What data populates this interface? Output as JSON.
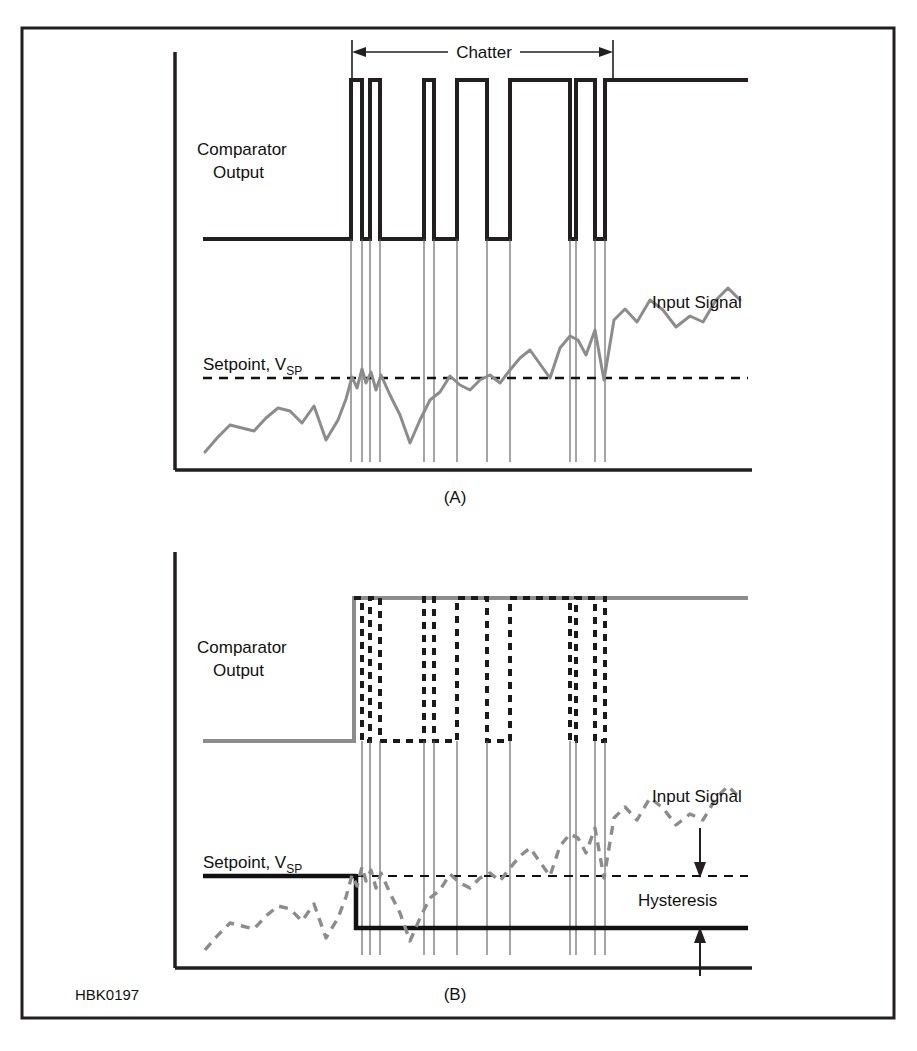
{
  "figure": {
    "code_label": "HBK0197",
    "border_color": "#231f20",
    "signal_color": "#8c8c8c",
    "trace_color": "#1a1a1a"
  },
  "panels": [
    {
      "id": "A",
      "panel_label": "(A)",
      "labels": {
        "comparator_line1": "Comparator",
        "comparator_line2": "Output",
        "input_signal": "Input Signal",
        "setpoint_main": "Setpoint, V",
        "setpoint_sub": "SP",
        "chatter": "Chatter"
      },
      "has_hysteresis": false,
      "comparator_style": "solid-black",
      "signal_style": "solid-gray"
    },
    {
      "id": "B",
      "panel_label": "(B)",
      "labels": {
        "comparator_line1": "Comparator",
        "comparator_line2": "Output",
        "input_signal": "Input Signal",
        "setpoint_main": "Setpoint, V",
        "setpoint_sub": "SP",
        "hysteresis": "Hysteresis"
      },
      "has_hysteresis": true,
      "comparator_style": "dashed-black-over-gray",
      "signal_style": "dashed-gray"
    }
  ],
  "chart_data": {
    "type": "line",
    "xlabel": "",
    "ylabel": "",
    "grid": false,
    "legend": "inline-annotations",
    "series": [
      {
        "name": "Input Signal (A)",
        "panel": "A",
        "style": "solid-gray",
        "x": [
          205,
          218,
          230,
          242,
          254,
          266,
          278,
          290,
          302,
          314,
          326,
          338,
          346,
          352,
          357,
          362,
          366,
          371,
          376,
          381,
          390,
          400,
          410,
          420,
          430,
          440,
          450,
          460,
          470,
          480,
          490,
          500,
          510,
          520,
          530,
          540,
          550,
          560,
          570,
          578,
          586,
          595,
          604,
          614,
          625,
          637,
          650,
          663,
          676,
          690,
          703,
          716,
          728,
          740
        ],
        "y": [
          452,
          437,
          425,
          428,
          431,
          418,
          408,
          411,
          423,
          406,
          440,
          420,
          399,
          377,
          388,
          369,
          383,
          372,
          390,
          375,
          395,
          415,
          443,
          420,
          400,
          392,
          376,
          385,
          390,
          380,
          375,
          383,
          370,
          358,
          350,
          364,
          378,
          348,
          336,
          340,
          355,
          330,
          380,
          320,
          309,
          322,
          300,
          310,
          327,
          316,
          322,
          300,
          288,
          300
        ]
      },
      {
        "name": "Comparator Output (A)",
        "panel": "A",
        "style": "solid-black-square-wave",
        "low_y": 239,
        "high_y": 80,
        "start_x": 203,
        "end_x": 748,
        "transitions": [
          351,
          362,
          370,
          380,
          424,
          434,
          457,
          487,
          510,
          570,
          576,
          595,
          605
        ]
      },
      {
        "name": "Setpoint (A)",
        "panel": "A",
        "style": "dashed-black",
        "y": 378,
        "x_start": 203,
        "x_end": 748
      },
      {
        "name": "Input Signal (B)",
        "panel": "B",
        "style": "dashed-gray",
        "x": [
          205,
          218,
          230,
          242,
          254,
          266,
          278,
          290,
          302,
          314,
          326,
          338,
          346,
          352,
          357,
          362,
          366,
          371,
          376,
          381,
          390,
          400,
          410,
          420,
          430,
          440,
          450,
          460,
          470,
          480,
          490,
          500,
          510,
          520,
          530,
          540,
          550,
          560,
          570,
          578,
          586,
          595,
          604,
          614,
          625,
          637,
          650,
          663,
          676,
          690,
          703,
          716,
          728,
          740
        ],
        "y": [
          950,
          935,
          923,
          926,
          929,
          916,
          906,
          909,
          921,
          904,
          938,
          918,
          897,
          875,
          886,
          867,
          881,
          870,
          888,
          873,
          893,
          913,
          941,
          918,
          898,
          890,
          874,
          883,
          888,
          878,
          873,
          881,
          868,
          856,
          848,
          862,
          876,
          846,
          834,
          838,
          853,
          828,
          878,
          818,
          807,
          820,
          798,
          808,
          825,
          814,
          820,
          798,
          786,
          798
        ]
      },
      {
        "name": "Comparator Output (B)",
        "panel": "B",
        "style": "dashed-black-square-wave",
        "low_y": 741,
        "high_y": 598,
        "start_x": 203,
        "end_x": 748,
        "rise_x": 354,
        "transitions": [
          354,
          362,
          370,
          380,
          424,
          434,
          457,
          487,
          510,
          570,
          576,
          595,
          605
        ]
      },
      {
        "name": "Setpoint upper threshold (B)",
        "panel": "B",
        "style": "solid-black-then-dashed",
        "y": 876,
        "x_start": 203,
        "x_step": 354,
        "x_end": 748
      },
      {
        "name": "Lower hysteresis threshold (B)",
        "panel": "B",
        "style": "solid-black",
        "y": 928,
        "x_start": 354,
        "x_end": 748
      }
    ],
    "annotations": [
      {
        "text": "Chatter",
        "panel": "A",
        "type": "span-arrow",
        "x_start": 352,
        "x_end": 613,
        "y": 52
      },
      {
        "text": "Input Signal",
        "panel": "A",
        "type": "label",
        "x": 655,
        "y": 308
      },
      {
        "text": "Setpoint, VSP",
        "panel": "A",
        "type": "label",
        "x": 203,
        "y": 366
      },
      {
        "text": "Input Signal",
        "panel": "B",
        "type": "label",
        "x": 655,
        "y": 802
      },
      {
        "text": "Setpoint, VSP",
        "panel": "B",
        "type": "label",
        "x": 203,
        "y": 864
      },
      {
        "text": "Hysteresis",
        "panel": "B",
        "type": "label",
        "x": 640,
        "y": 905
      },
      {
        "text": "hysteresis-gap-arrows",
        "panel": "B",
        "type": "double-arrow",
        "x": 700,
        "y_top": 876,
        "y_bottom": 928
      }
    ]
  }
}
